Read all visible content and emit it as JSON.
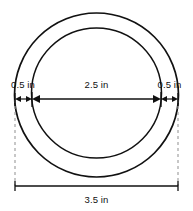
{
  "figure": {
    "title": "Concentric circles ring diagram with dimension callouts",
    "background_color": "#ffffff",
    "stroke_color": "#111111",
    "dashed_guide_color": "#9a9a9a",
    "width": 193,
    "height": 211,
    "shapes": {
      "outer_circle": {
        "name": "outer-circle",
        "cx": 96.5,
        "cy": 95,
        "r": 82,
        "stroke_width": 1.7
      },
      "inner_circle": {
        "name": "inner-circle",
        "cx": 96.5,
        "cy": 93,
        "r": 65,
        "stroke_width": 1.5
      }
    },
    "dimensions": [
      {
        "id": "left-band",
        "label": "0.5 in",
        "value": 0.5,
        "unit": "in",
        "x1": 15,
        "x2": 32,
        "y": 99,
        "label_x": 23,
        "label_y": 88
      },
      {
        "id": "inner-diameter",
        "label": "2.5 in",
        "value": 2.5,
        "unit": "in",
        "x1": 32,
        "x2": 161,
        "y": 99,
        "label_x": 96.5,
        "label_y": 88
      },
      {
        "id": "right-band",
        "label": "0.5 in",
        "value": 0.5,
        "unit": "in",
        "x1": 161,
        "x2": 178,
        "y": 99,
        "label_x": 169.5,
        "label_y": 88
      },
      {
        "id": "outer-diameter",
        "label": "3.5 in",
        "value": 3.5,
        "unit": "in",
        "x1": 15,
        "x2": 178,
        "y": 186,
        "label_x": 96.5,
        "label_y": 202
      }
    ],
    "extension_lines": [
      {
        "id": "left-extension",
        "x": 15,
        "y1": 100,
        "y2": 186
      },
      {
        "id": "right-extension",
        "x": 178,
        "y1": 100,
        "y2": 186
      }
    ]
  }
}
